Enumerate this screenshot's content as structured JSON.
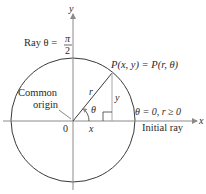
{
  "diagram": {
    "axes": {
      "x_label": "x",
      "y_label": "y",
      "origin_label": "0"
    },
    "labels": {
      "ray_vertical": "Ray θ = ",
      "pi": "π",
      "two": "2",
      "point": "P(x, y) = P(r, θ)",
      "radius": "r",
      "angle": "θ",
      "x_leg": "x",
      "y_leg": "y",
      "common": "Common",
      "origin": "origin",
      "initial_condition": "θ = 0, r ≥ 0",
      "initial_ray": "Initial ray"
    },
    "colors": {
      "axis": "#8a8a8a",
      "curve": "#3a3a3a",
      "leg": "#a8a8a8",
      "text": "#2a2a2a"
    }
  }
}
